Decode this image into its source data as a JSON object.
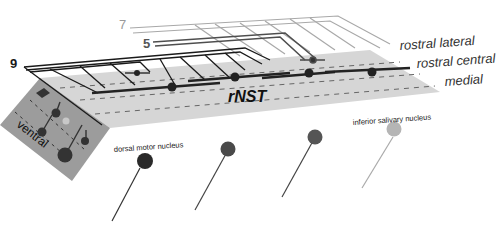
{
  "diagram": {
    "title": "rNST",
    "nerve_labels": [
      {
        "id": "7",
        "label": "7",
        "color": "#9a9a9a"
      },
      {
        "id": "5",
        "label": "5",
        "color": "#555555"
      },
      {
        "id": "9",
        "label": "9",
        "color": "#1a1a1a"
      }
    ],
    "subdivisions": [
      {
        "label": "rostral lateral"
      },
      {
        "label": "rostral central"
      },
      {
        "label": "medial"
      }
    ],
    "face_label": "ventral",
    "nuclei": [
      {
        "label": "dorsal motor nucleus",
        "color": "#2a2a2a"
      },
      {
        "label": "",
        "color": "#4a4a4a"
      },
      {
        "label": "",
        "color": "#555555"
      },
      {
        "label": "inferior salivary nucleus",
        "color": "#b5b5b5"
      }
    ],
    "colors": {
      "slab_top": "#d6d6d6",
      "slab_side": "#9c9c9c",
      "dark_line": "#222222",
      "mid_line": "#555555",
      "light_line": "#a8a8a8"
    }
  }
}
